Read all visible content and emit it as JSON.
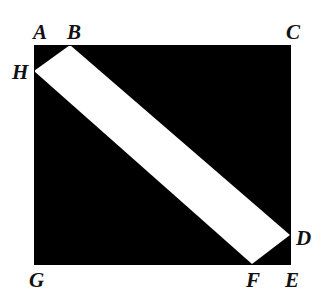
{
  "figure": {
    "type": "geometry-diagram",
    "width": 323,
    "height": 305,
    "colors": {
      "fill": "#000000",
      "band": "#ffffff",
      "background": "#ffffff",
      "outline": "#000000",
      "label": "#111111"
    },
    "square": {
      "left": 34,
      "top": 45,
      "right": 290,
      "bottom": 264
    },
    "band": {
      "upper_edge": {
        "from": "B",
        "to": "D"
      },
      "lower_edge": {
        "from": "H",
        "to": "F"
      },
      "orientation": "upper-left to lower-right"
    },
    "points": [
      {
        "id": "A",
        "label": "A",
        "x": 34,
        "y": 45,
        "label_x": 33,
        "label_y": 22,
        "role": "square-corner-top-left"
      },
      {
        "id": "B",
        "label": "B",
        "x": 70,
        "y": 45,
        "label_x": 67,
        "label_y": 22,
        "role": "band-upper-edge-on-top-side"
      },
      {
        "id": "C",
        "label": "C",
        "x": 290,
        "y": 45,
        "label_x": 286,
        "label_y": 22,
        "role": "square-corner-top-right"
      },
      {
        "id": "D",
        "label": "D",
        "x": 290,
        "y": 235,
        "label_x": 296,
        "label_y": 228,
        "role": "band-upper-edge-on-right-side"
      },
      {
        "id": "E",
        "label": "E",
        "x": 290,
        "y": 264,
        "label_x": 285,
        "label_y": 270,
        "role": "square-corner-bottom-right"
      },
      {
        "id": "F",
        "label": "F",
        "x": 252,
        "y": 264,
        "label_x": 246,
        "label_y": 270,
        "role": "band-lower-edge-on-bottom-side"
      },
      {
        "id": "G",
        "label": "G",
        "x": 34,
        "y": 264,
        "label_x": 29,
        "label_y": 270,
        "role": "square-corner-bottom-left"
      },
      {
        "id": "H",
        "label": "H",
        "x": 34,
        "y": 71,
        "label_x": 12,
        "label_y": 62,
        "role": "band-lower-edge-on-left-side"
      }
    ]
  },
  "clipped_text": {
    "left_fragment": "G",
    "right_fragment": ""
  }
}
